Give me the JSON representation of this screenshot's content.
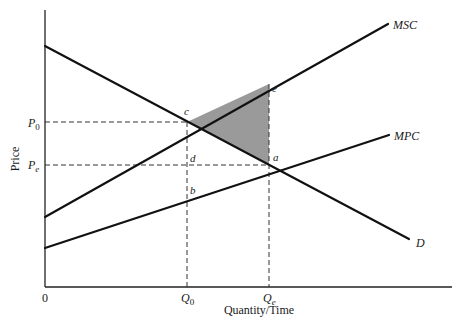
{
  "diagram": {
    "type": "economics-externality",
    "axes": {
      "y_label": "Price",
      "x_label": "Quantity/Time",
      "origin_label": "0"
    },
    "price_ticks": {
      "p0": {
        "main": "P",
        "sub": "0"
      },
      "pe": {
        "main": "P",
        "sub": "e"
      }
    },
    "quantity_ticks": {
      "q0": {
        "main": "Q",
        "sub": "0"
      },
      "qe": {
        "main": "Q",
        "sub": "e"
      }
    },
    "curves": {
      "msc": "MSC",
      "mpc": "MPC",
      "d": "D"
    },
    "points": {
      "a": "a",
      "b": "b",
      "c": "c",
      "d": "d",
      "e": "e"
    },
    "shaded_region": {
      "vertices": [
        "c",
        "e",
        "a"
      ],
      "color": "#9a9a9a"
    },
    "colors": {
      "line": "#111111",
      "dashed": "#333333",
      "background": "#ffffff"
    }
  }
}
